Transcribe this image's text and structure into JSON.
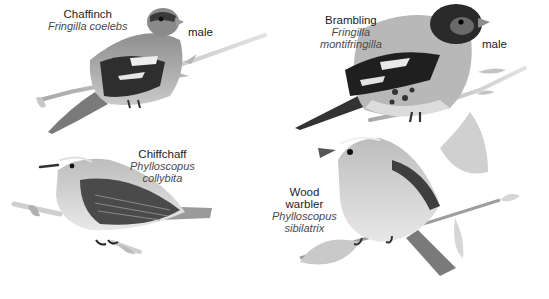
{
  "page": {
    "background": "#ffffff",
    "species": [
      {
        "id": "chaffinch",
        "common_name": "Chaffinch",
        "latin_name": [
          "Fringilla coelebs"
        ],
        "sex": "male"
      },
      {
        "id": "brambling",
        "common_name": "Brambling",
        "latin_name": [
          "Fringilla",
          "montifringilla"
        ],
        "sex": "male"
      },
      {
        "id": "chiffchaff",
        "common_name": "Chiffchaff",
        "latin_name": [
          "Phylloscopus",
          "collybita"
        ]
      },
      {
        "id": "wood-warbler",
        "common_name": [
          "Wood",
          "warbler"
        ],
        "latin_name": [
          "Phylloscopus",
          "sibilatrix"
        ]
      }
    ]
  }
}
